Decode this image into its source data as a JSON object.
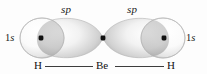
{
  "figure": {
    "width": 207,
    "height": 74,
    "background_color": "#fdfdfd"
  },
  "labels": {
    "sp_left": "sp",
    "sp_right": "sp",
    "one_s_left_n": "1",
    "one_s_left_orbital": "s",
    "one_s_right_n": "1",
    "one_s_right_orbital": "s"
  },
  "formula": {
    "hydrogen_left": "H",
    "central_atom": "Be",
    "hydrogen_right": "H",
    "bond_color": "#3d3d3d"
  },
  "orbitals": {
    "sp_lobe_fill_light": "#fbfbfb",
    "sp_lobe_fill_mid": "#d8d8d8",
    "sp_lobe_fill_dark": "#9d9d9d",
    "sphere_fill_light": "#ffffff",
    "sphere_fill_shade": "#c9c9c9",
    "outline_color": "#b9b9b9",
    "nucleus_color": "#111111",
    "nuclei": [
      {
        "name": "hydrogen-left-nucleus",
        "x": 41,
        "y": 38
      },
      {
        "name": "beryllium-nucleus",
        "x": 103,
        "y": 38
      },
      {
        "name": "hydrogen-right-nucleus",
        "x": 164,
        "y": 38
      }
    ]
  }
}
